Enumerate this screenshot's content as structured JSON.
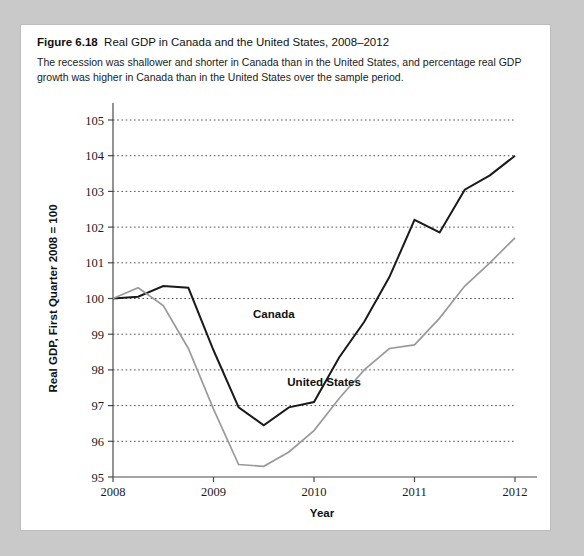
{
  "figure": {
    "label": "Figure 6.18",
    "title": "Real GDP in Canada and the United States, 2008–2012",
    "subtitle": "The recession was shallower and shorter in Canada than in the United States, and percentage real GDP growth was higher in Canada than in the United States over the sample period."
  },
  "colors": {
    "panel_background": "#ffffff",
    "page_background": "#c9c9c9",
    "canada_line": "#1a1a1a",
    "united_states_line": "#9a9a9a",
    "gridline": "#555555",
    "axis": "#4a4a4a"
  },
  "chart_data": {
    "type": "line",
    "title": "Real GDP in Canada and the United States, 2008–2012",
    "xlabel": "Year",
    "ylabel": "Real GDP, First Quarter 2008 = 100",
    "xlim": [
      2008,
      2012
    ],
    "ylim": [
      95,
      105
    ],
    "xticks": [
      "2008",
      "2009",
      "2010",
      "2011",
      "2012"
    ],
    "yticks": [
      "95",
      "96",
      "97",
      "98",
      "99",
      "100",
      "101",
      "102",
      "103",
      "104",
      "105"
    ],
    "grid": true,
    "legend_position": "inline-annotation",
    "x": [
      2008.0,
      2008.25,
      2008.5,
      2008.75,
      2009.0,
      2009.25,
      2009.5,
      2009.75,
      2010.0,
      2010.25,
      2010.5,
      2010.75,
      2011.0,
      2011.25,
      2011.5,
      2011.75,
      2012.0
    ],
    "series": [
      {
        "name": "Canada",
        "color": "#1a1a1a",
        "values": [
          100.0,
          100.05,
          100.35,
          100.3,
          98.55,
          96.95,
          96.45,
          96.95,
          97.1,
          98.35,
          99.35,
          100.6,
          102.2,
          101.85,
          103.05,
          103.45,
          104.0
        ]
      },
      {
        "name": "United States",
        "color": "#9a9a9a",
        "values": [
          100.0,
          100.3,
          99.8,
          98.6,
          96.9,
          95.35,
          95.3,
          95.7,
          96.3,
          97.2,
          98.0,
          98.6,
          98.7,
          99.45,
          100.35,
          101.0,
          101.7
        ]
      }
    ],
    "annotations": [
      {
        "text": "Canada",
        "x": 2009.6,
        "y": 99.45
      },
      {
        "text": "United States",
        "x": 2010.1,
        "y": 97.55
      }
    ]
  }
}
